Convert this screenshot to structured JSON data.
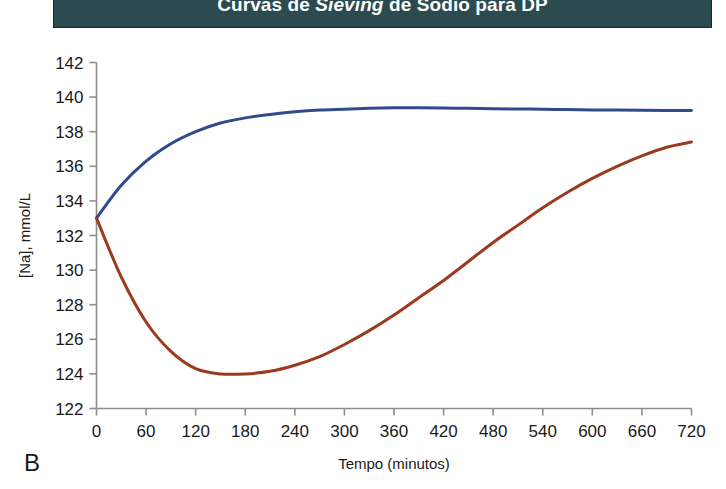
{
  "title": {
    "full": "Curvas de Sieving de Sodio para DP",
    "part_before": "Curvas de ",
    "part_italic": "Sieving",
    "part_after": " de Sodio para DP"
  },
  "panel": {
    "label": "B"
  },
  "colors": {
    "banner_bg": "#2c4b50",
    "banner_text": "#ffffff",
    "axis": "#8d8d8d",
    "series_blue": "#2f4b8e",
    "series_red": "#9c3a20"
  },
  "chart_data": {
    "type": "line",
    "title": "Curvas de Sieving de Sodio para DP",
    "xlabel": "Tempo (minutos)",
    "ylabel": "[Na], mmol/L",
    "xlim": [
      0,
      720
    ],
    "ylim": [
      122,
      142
    ],
    "xticks": [
      0,
      60,
      120,
      180,
      240,
      300,
      360,
      420,
      480,
      540,
      600,
      660,
      720
    ],
    "yticks": [
      122,
      124,
      126,
      128,
      130,
      132,
      134,
      136,
      138,
      140,
      142
    ],
    "grid": false,
    "legend": "none",
    "x": [
      0,
      30,
      60,
      90,
      120,
      150,
      180,
      210,
      240,
      270,
      300,
      330,
      360,
      390,
      420,
      450,
      480,
      510,
      540,
      570,
      600,
      630,
      660,
      690,
      720
    ],
    "series": [
      {
        "name": "curva-azul",
        "color": "#2f4b8e",
        "values": [
          133.0,
          134.9,
          136.3,
          137.3,
          138.0,
          138.5,
          138.8,
          139.0,
          139.15,
          139.25,
          139.3,
          139.35,
          139.38,
          139.38,
          139.37,
          139.35,
          139.33,
          139.31,
          139.3,
          139.28,
          139.26,
          139.25,
          139.24,
          139.23,
          139.22
        ]
      },
      {
        "name": "curva-vermelha",
        "color": "#9c3a20",
        "values": [
          133.0,
          129.6,
          127.0,
          125.3,
          124.3,
          124.0,
          124.0,
          124.15,
          124.5,
          125.0,
          125.7,
          126.5,
          127.4,
          128.4,
          129.4,
          130.5,
          131.6,
          132.6,
          133.6,
          134.5,
          135.3,
          136.0,
          136.6,
          137.1,
          137.4
        ]
      }
    ]
  }
}
